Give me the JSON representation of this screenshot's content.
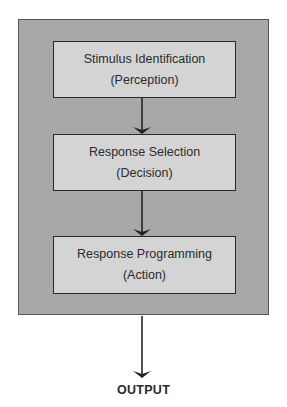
{
  "diagram": {
    "type": "flowchart",
    "direction": "top-to-bottom",
    "container": {
      "fill": "#a8a8a8",
      "border": "#555555"
    },
    "stages": [
      {
        "title": "Stimulus Identification",
        "subtitle": "(Perception)"
      },
      {
        "title": "Response Selection",
        "subtitle": "(Decision)"
      },
      {
        "title": "Response Programming",
        "subtitle": "(Action)"
      }
    ],
    "stage_fill": "#d4d4d4",
    "edges": [
      {
        "from": "Stimulus Identification",
        "to": "Response Selection"
      },
      {
        "from": "Response Selection",
        "to": "Response Programming"
      },
      {
        "from": "Response Programming",
        "to": "OUTPUT"
      }
    ],
    "output_label": "OUTPUT"
  }
}
